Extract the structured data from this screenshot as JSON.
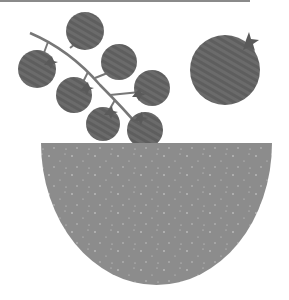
{
  "illustration": {
    "subject": "Cherry tomatoes on a vine with a large tomato above a bowl",
    "colors": {
      "tomato": "#5e5e5e",
      "tomato_stripe": "#6e6e6e",
      "stem": "#777777",
      "bowl": "#8c8c8c",
      "speckle": "#d8d8d8",
      "top_line": "#8a8a8a",
      "background": "#ffffff"
    },
    "vine_tomatoes": [
      {
        "cx": 85,
        "cy": 31,
        "r": 19
      },
      {
        "cx": 37,
        "cy": 69,
        "r": 19
      },
      {
        "cx": 119,
        "cy": 62,
        "r": 18
      },
      {
        "cx": 74,
        "cy": 95,
        "r": 18
      },
      {
        "cx": 152,
        "cy": 88,
        "r": 18
      },
      {
        "cx": 103,
        "cy": 124,
        "r": 17
      },
      {
        "cx": 145,
        "cy": 130,
        "r": 18
      }
    ],
    "large_tomato": {
      "cx": 225,
      "cy": 70,
      "r": 35
    },
    "bowl": {
      "left": 41,
      "right": 272,
      "top": 143,
      "bottom": 285
    }
  }
}
